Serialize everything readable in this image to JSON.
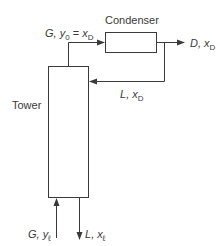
{
  "diagram": {
    "type": "process-flow",
    "nodes": {
      "tower": {
        "label": "Tower"
      },
      "condenser": {
        "label": "Condenser"
      }
    },
    "streams": {
      "vapor_top": {
        "var": "G",
        "comp": "y",
        "comp_sub": "0",
        "eq": "=",
        "eq_var": "x",
        "eq_sub": "D"
      },
      "distillate": {
        "var": "D",
        "comp": "x",
        "comp_sub": "D"
      },
      "reflux": {
        "var": "L",
        "comp": "x",
        "comp_sub": "D"
      },
      "vapor_bottom": {
        "var": "G",
        "comp": "y",
        "comp_sub": "ℓ"
      },
      "liquid_bottom": {
        "var": "L",
        "comp": "x",
        "comp_sub": "ℓ"
      }
    },
    "colors": {
      "line": "#3a3a3a",
      "background": "#ffffff"
    }
  }
}
